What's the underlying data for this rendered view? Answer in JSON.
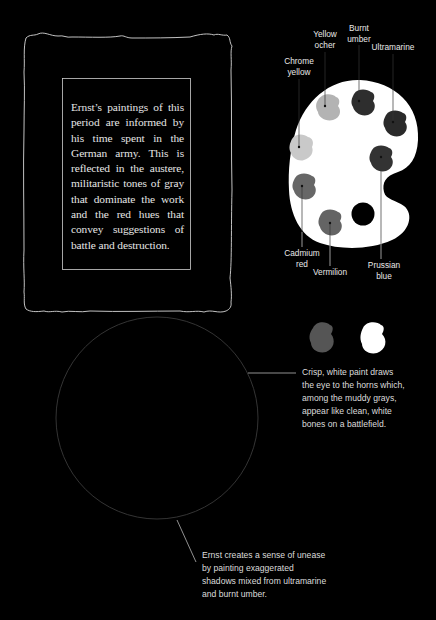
{
  "frame": {
    "description_lines": [
      "Ernst’s paintings of this",
      "period are informed by",
      "his time spent in the",
      "German army. This is",
      "reflected in the austere,",
      "militaristic tones of gray",
      "that dominate the work",
      "and the red hues that",
      "convey suggestions of",
      "battle and destruction."
    ]
  },
  "palette": {
    "colors": [
      {
        "name": "Chrome yellow",
        "line1": "Chrome",
        "line2": "yellow",
        "swatch": "#c9c9c9"
      },
      {
        "name": "Yellow ocher",
        "line1": "Yellow",
        "line2": "ocher",
        "swatch": "#b3b3b3"
      },
      {
        "name": "Burnt umber",
        "line1": "Burnt",
        "line2": "umber",
        "swatch": "#2e2e2e"
      },
      {
        "name": "Ultramarine",
        "line1": "Ultramarine",
        "line2": "",
        "swatch": "#2a2a2a"
      },
      {
        "name": "Prussian blue",
        "line1": "Prussian",
        "line2": "blue",
        "swatch": "#333333"
      },
      {
        "name": "Cadmium red",
        "line1": "Cadmium",
        "line2": "red",
        "swatch": "#676767"
      },
      {
        "name": "Vermilion",
        "line1": "Vermilion",
        "line2": "",
        "swatch": "#646464"
      }
    ]
  },
  "swatches": {
    "gray": "#555555",
    "white": "#ffffff"
  },
  "annotations": {
    "horns_lines": [
      "Crisp, white paint draws",
      "the eye to the horns which,",
      "among the muddy grays,",
      "appear like clean, white",
      "bones on a battlefield."
    ],
    "shadows_lines": [
      "Ernst creates a sense of unease",
      "by painting exaggerated",
      "shadows mixed from ultramarine",
      "and burnt umber."
    ]
  }
}
